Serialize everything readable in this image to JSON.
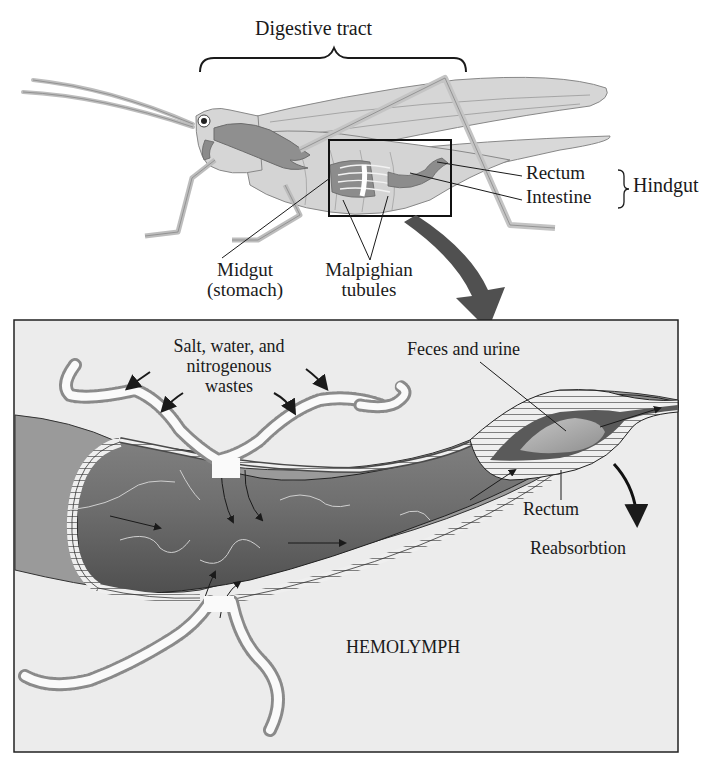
{
  "diagram": {
    "top": {
      "digestive_tract_label": "Digestive tract",
      "rectum_label": "Rectum",
      "intestine_label": "Intestine",
      "hindgut_label": "Hindgut",
      "midgut_label_line1": "Midgut",
      "midgut_label_line2": "(stomach)",
      "malpighian_label_line1": "Malpighian",
      "malpighian_label_line2": "tubules"
    },
    "detail": {
      "salt_label_line1": "Salt, water, and",
      "salt_label_line2": "nitrogenous",
      "salt_label_line3": "wastes",
      "feces_label": "Feces and urine",
      "rectum_label": "Rectum",
      "reabsorption_label": "Reabsorbtion",
      "hemolymph_label": "HEMOLYMPH"
    },
    "colors": {
      "background": "#ffffff",
      "panel_fill": "#ececec",
      "insect_fill": "#d4d4d4",
      "gut_dark": "#6e6e6e",
      "gut_mid": "#9a9a9a",
      "tubule_stripe": "#8a8a8a",
      "callout_arrow": "#4a4a4a",
      "ink": "#1a1a1a"
    }
  }
}
